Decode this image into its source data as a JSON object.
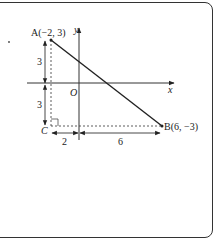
{
  "diagram": {
    "points": {
      "A": {
        "label": "A(−2, 3)",
        "x": -2,
        "y": 3
      },
      "B": {
        "label": "B(6, −3)",
        "x": 6,
        "y": -3
      },
      "C": {
        "label": "C"
      }
    },
    "axes": {
      "x_label": "x",
      "y_label": "y",
      "origin_label": "O"
    },
    "dimensions": {
      "vertical_upper": "3",
      "vertical_lower": "3",
      "horizontal_left": "2",
      "horizontal_right": "6"
    },
    "colors": {
      "line": "#222222",
      "frame": "#333333"
    }
  }
}
